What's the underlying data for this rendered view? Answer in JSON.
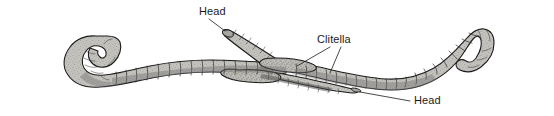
{
  "figure": {
    "background_color": "#ffffff",
    "width": 554,
    "height": 116,
    "body_fill_color": "#b9b7b2",
    "outline_color": "#1b1b1b",
    "label_color": "#1a1a1a"
  },
  "labels": {
    "head_upper": "Head",
    "clitella": "Clitella",
    "head_lower": "Head"
  },
  "specimens": [
    {
      "name": "upper-worm",
      "description": "Worm running from lower-left curled tail, rightward and upward to head at upper center-right"
    },
    {
      "name": "lower-worm",
      "description": "Worm running from head at lower center-right leftward, crossing under, then right to curled tail at far right"
    }
  ]
}
